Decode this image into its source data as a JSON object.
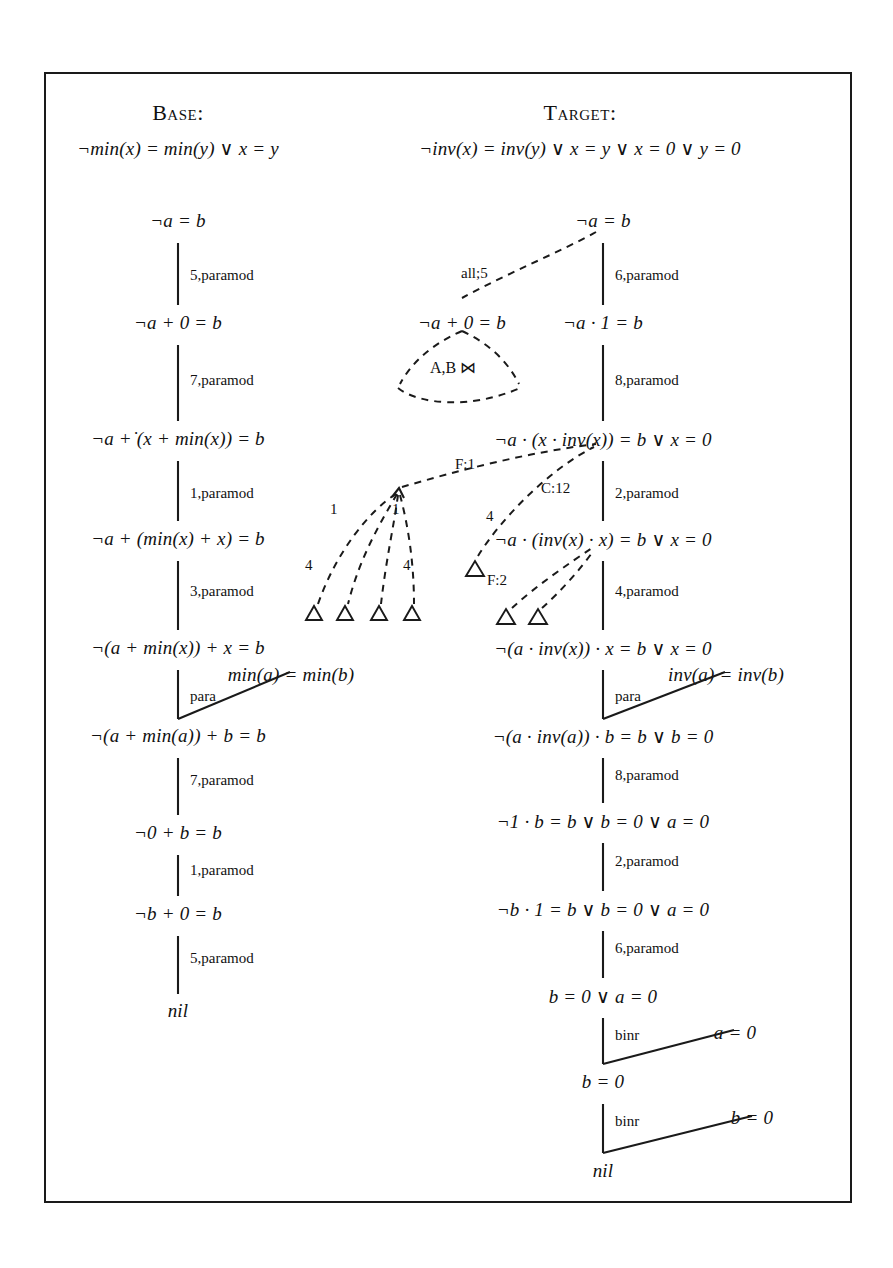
{
  "figure": {
    "kind": "proof-tree-diagram",
    "columns": [
      {
        "id": "base",
        "header": "Base:",
        "axiom": "¬min(x) = min(y) ∨ x = y",
        "steps": [
          {
            "formula": "¬a = b",
            "justification": "5,paramod"
          },
          {
            "formula": "¬a + 0 = b",
            "justification": "7,paramod"
          },
          {
            "formula": "¬a +̇ (x + min(x)) = b",
            "justification": "1,paramod"
          },
          {
            "formula": "¬a + (min(x) + x) = b",
            "justification": "3,paramod"
          },
          {
            "formula": "¬(a + min(x)) + x = b",
            "justification": "para"
          },
          {
            "formula": "¬(a + min(a)) + b = b",
            "justification": "7,paramod"
          },
          {
            "formula": "¬0 + b = b",
            "justification": "1,paramod"
          },
          {
            "formula": "¬b + 0 = b",
            "justification": "5,paramod"
          },
          {
            "formula": "nil",
            "justification": ""
          }
        ],
        "side_premises": [
          {
            "label": "para",
            "formula": "min(a) = min(b)"
          }
        ]
      },
      {
        "id": "target",
        "header": "Target:",
        "axiom": "¬inv(x) = inv(y) ∨ x = y ∨ x = 0 ∨ y = 0",
        "steps": [
          {
            "formula": "¬a = b",
            "justification": "6,paramod"
          },
          {
            "formula": "¬a · 1 = b",
            "justification": "8,paramod"
          },
          {
            "formula": "¬a · (x · inv(x)) = b ∨ x = 0",
            "justification": "2,paramod"
          },
          {
            "formula": "¬a · (inv(x) · x) = b ∨ x = 0",
            "justification": "4,paramod"
          },
          {
            "formula": "¬(a · inv(x)) · x = b ∨ x = 0",
            "justification": "para"
          },
          {
            "formula": "¬(a · inv(a)) · b = b ∨ b = 0",
            "justification": "8,paramod"
          },
          {
            "formula": "¬1 · b = b ∨ b = 0 ∨ a = 0",
            "justification": "2,paramod"
          },
          {
            "formula": "¬b · 1 = b ∨ b = 0 ∨ a = 0",
            "justification": "6,paramod"
          },
          {
            "formula": "b = 0 ∨ a = 0",
            "justification": "binr"
          },
          {
            "formula": "b = 0",
            "justification": "binr"
          },
          {
            "formula": "nil",
            "justification": ""
          }
        ],
        "side_premises": [
          {
            "label": "para",
            "formula": "inv(a) = inv(b)"
          },
          {
            "label": "binr",
            "formula": "a = 0"
          },
          {
            "label": "binr",
            "formula": "b = 0"
          }
        ]
      }
    ],
    "annotations": {
      "analogy_node": {
        "formula": "¬a + 0 = b",
        "fan_label": "A,B ⋈",
        "link_label": "all;5"
      },
      "branch_labels": [
        "1",
        "1",
        "4",
        "4",
        "F:1",
        "C:12",
        "4",
        "F:2"
      ],
      "fan_labels_left": [
        "1",
        "1",
        "4",
        "4"
      ],
      "mapping_labels": [
        "F:1",
        "C:12",
        "F:2"
      ],
      "leaf_marker": "triangle"
    }
  }
}
